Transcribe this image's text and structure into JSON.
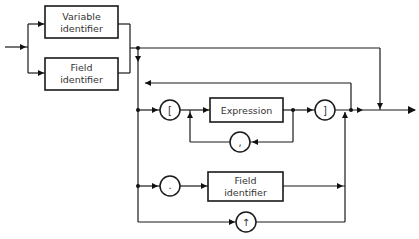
{
  "diagram": {
    "type": "syntax-diagram",
    "boxes": {
      "variable_identifier": {
        "line1": "Variable",
        "line2": "identifier"
      },
      "field_identifier_top": {
        "line1": "Field",
        "line2": "identifier"
      },
      "expression": {
        "label": "Expression"
      },
      "field_identifier_bottom": {
        "line1": "Field",
        "line2": "identifier"
      }
    },
    "terminals": {
      "open_bracket": "[",
      "close_bracket": "]",
      "comma": ",",
      "period": ".",
      "pointer": "↑"
    },
    "colors": {
      "stroke": "#1a1a1a",
      "background": "#ffffff",
      "text": "#333333"
    }
  }
}
